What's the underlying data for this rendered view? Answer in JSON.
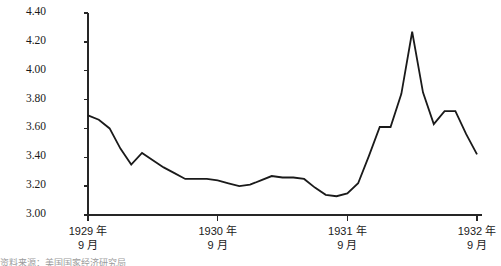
{
  "chart_data": {
    "type": "line",
    "title": "",
    "xlabel": "",
    "ylabel": "",
    "ylim": [
      3.0,
      4.4
    ],
    "ytick_values": [
      3.0,
      3.2,
      3.4,
      3.6,
      3.8,
      4.0,
      4.2,
      4.4
    ],
    "ytick_labels": [
      "3.00",
      "3.20",
      "3.40",
      "3.60",
      "3.80",
      "4.00",
      "4.20",
      "4.40"
    ],
    "grid": false,
    "legend": "none",
    "xtick_labels": [
      "1929 年\n9 月",
      "1930 年\n9 月",
      "1931 年\n9 月",
      "1932 年\n9 月"
    ],
    "xticks": [
      {
        "year": "1929 年",
        "month": "9 月",
        "x_index": 0
      },
      {
        "year": "1930 年",
        "month": "9 月",
        "x_index": 12
      },
      {
        "year": "1931 年",
        "month": "9 月",
        "x_index": 24
      },
      {
        "year": "1932 年",
        "month": "9 月",
        "x_index": 36
      }
    ],
    "x": [
      0,
      1,
      2,
      3,
      4,
      5,
      6,
      7,
      8,
      9,
      10,
      11,
      12,
      13,
      14,
      15,
      16,
      17,
      18,
      19,
      20,
      21,
      22,
      23,
      24,
      25,
      26,
      27,
      28,
      29,
      30,
      31,
      32,
      33,
      34,
      35,
      36
    ],
    "series": [
      {
        "name": "",
        "color": "#1a1a1a",
        "values": [
          3.69,
          3.66,
          3.6,
          3.46,
          3.35,
          3.43,
          3.38,
          3.33,
          3.29,
          3.25,
          3.25,
          3.25,
          3.24,
          3.22,
          3.2,
          3.21,
          3.24,
          3.27,
          3.26,
          3.26,
          3.25,
          3.19,
          3.14,
          3.13,
          3.15,
          3.22,
          3.41,
          3.61,
          3.61,
          3.84,
          4.27,
          3.85,
          3.63,
          3.72,
          3.72,
          3.56,
          3.42
        ]
      }
    ]
  },
  "caption": "资料来源：美国国家经济研究局"
}
